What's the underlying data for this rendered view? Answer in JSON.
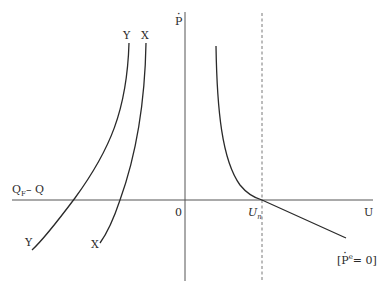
{
  "diagram": {
    "type": "phillips-curve-diagram",
    "axes": {
      "vertical_label": "P",
      "vertical_label_dot": true,
      "horizontal_right_label": "U",
      "horizontal_left_label": "Q",
      "horizontal_left_label_sub": "F",
      "horizontal_left_label_suffix": "– Q",
      "origin_label": "0"
    },
    "natural_rate": {
      "label": "U",
      "label_sub": "n",
      "line_style": "dashed"
    },
    "curves": [
      {
        "name": "Y",
        "top_label": "Y",
        "bottom_label": "Y"
      },
      {
        "name": "X",
        "top_label": "X",
        "bottom_label": "X"
      },
      {
        "name": "expected-inflation-zero",
        "label_open": "[",
        "label_p": "P",
        "label_sup": "e",
        "label_eq": "= 0]"
      }
    ],
    "colors": {
      "line": "#2a2a2a",
      "axis": "#555555",
      "background": "#ffffff"
    }
  }
}
